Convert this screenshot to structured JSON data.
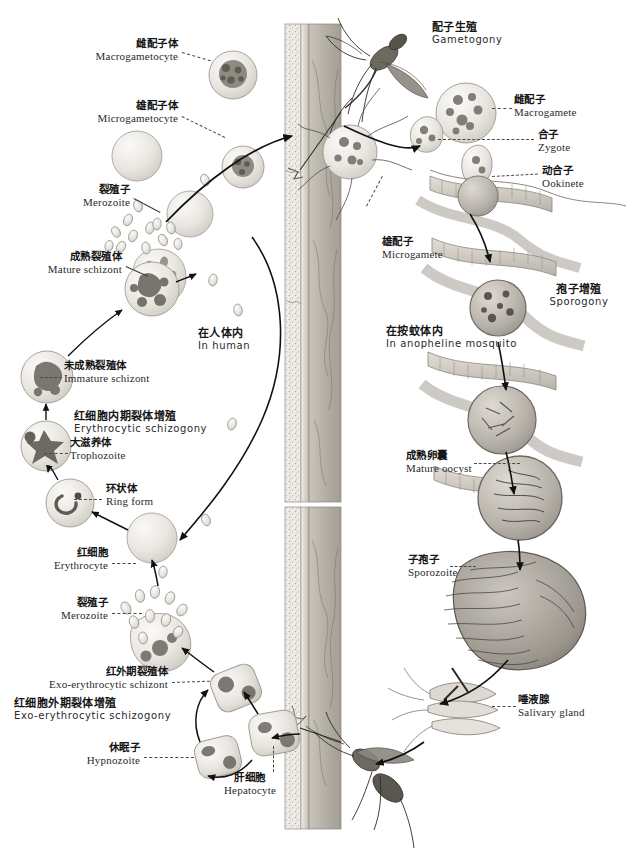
{
  "figure": {
    "title_cn": "疟原虫生活史",
    "title_en": "Life cycle of Plasmodium",
    "width": 626,
    "height": 859,
    "style": "grayscale scientific illustration"
  },
  "colors": {
    "background": "#ffffff",
    "ink": "#1b1b1b",
    "label_en": "#2a2a2a",
    "leader": "#4a4a4a",
    "arrow": "#111111",
    "cell_fill": "#e8e6e2",
    "cell_stroke": "#9a978f",
    "nucleus": "#6f6b63",
    "skin_outer": "#d8d4cd",
    "skin_inner": "#b9b4ab",
    "vessel": "#a9a49b",
    "mosquito": "#6b6760",
    "gut_wall": "#cfcac2"
  },
  "regions": {
    "human": {
      "cn": "在人体内",
      "en": "In human",
      "x": 196,
      "y": 330
    },
    "mosquito": {
      "cn": "在按蚊体内",
      "en": "In anopheline mosquito",
      "x": 393,
      "y": 328
    }
  },
  "processes": [
    {
      "name": "erythrocytic-schizogony",
      "cn": "红细胞内期裂体增殖",
      "en": "Erythrocytic schizogony",
      "x": 72,
      "y": 413,
      "align": "left"
    },
    {
      "name": "exo-erythrocytic-schizogony",
      "cn": "红细胞外期裂体增殖",
      "en": "Exo-erythrocytic schizogony",
      "x": 12,
      "y": 700,
      "align": "left"
    },
    {
      "name": "gametogony",
      "cn": "配子生殖",
      "en": "Gametogony",
      "x": 430,
      "y": 24,
      "align": "left"
    },
    {
      "name": "sporogony",
      "cn": "孢子增殖",
      "en": "Sporogony",
      "x": 578,
      "y": 286,
      "align": "center"
    }
  ],
  "labels": [
    {
      "name": "macrogametocyte",
      "cn": "雌配子体",
      "en": "Macrogametocyte",
      "x": 178,
      "y": 40,
      "align": "right"
    },
    {
      "name": "microgametocyte",
      "cn": "雄配子体",
      "en": "Microgametocyte",
      "x": 178,
      "y": 102,
      "align": "right"
    },
    {
      "name": "merozoite-upper",
      "cn": "裂殖子",
      "en": "Merozoite",
      "x": 130,
      "y": 186,
      "align": "right"
    },
    {
      "name": "mature-schizont",
      "cn": "成熟裂殖体",
      "en": "Mature schizont",
      "x": 122,
      "y": 253,
      "align": "right"
    },
    {
      "name": "immature-schizont",
      "cn": "未成熟裂殖体",
      "en": "Immature schizont",
      "x": 60,
      "y": 362,
      "align": "left"
    },
    {
      "name": "trophozoite",
      "cn": "大滋养体",
      "en": "Trophozoite",
      "x": 66,
      "y": 440,
      "align": "left"
    },
    {
      "name": "ring-form",
      "cn": "环状体",
      "en": "Ring form",
      "x": 104,
      "y": 487,
      "align": "left"
    },
    {
      "name": "erythrocyte",
      "cn": "红细胞",
      "en": "Erythrocyte",
      "x": 108,
      "y": 550,
      "align": "right"
    },
    {
      "name": "merozoite-lower",
      "cn": "裂殖子",
      "en": "Merozoite",
      "x": 108,
      "y": 600,
      "align": "right"
    },
    {
      "name": "exo-erythrocytic-schizont",
      "cn": "红外期裂殖体",
      "en": "Exo-erythrocytic schizont",
      "x": 168,
      "y": 668,
      "align": "right"
    },
    {
      "name": "hypnozoite",
      "cn": "休眠子",
      "en": "Hypnozoite",
      "x": 140,
      "y": 744,
      "align": "right"
    },
    {
      "name": "hepatocyte",
      "cn": "肝细胞",
      "en": "Hepatocyte",
      "x": 250,
      "y": 778,
      "align": "center"
    },
    {
      "name": "macrogamete",
      "cn": "雌配子",
      "en": "Macrogamete",
      "x": 512,
      "y": 96,
      "align": "left"
    },
    {
      "name": "zygote",
      "cn": "合子",
      "en": "Zygote",
      "x": 536,
      "y": 131,
      "align": "left"
    },
    {
      "name": "ookinete",
      "cn": "动合子",
      "en": "Ookinete",
      "x": 540,
      "y": 167,
      "align": "left"
    },
    {
      "name": "microgamete",
      "cn": "雄配子",
      "en": "Microgamete",
      "x": 380,
      "y": 238,
      "align": "left"
    },
    {
      "name": "mature-oocyst",
      "cn": "成熟卵囊",
      "en": "Mature oocyst",
      "x": 404,
      "y": 452,
      "align": "left"
    },
    {
      "name": "sporozoite",
      "cn": "子孢子",
      "en": "Sporozoite",
      "x": 406,
      "y": 556,
      "align": "left"
    },
    {
      "name": "salivary-gland",
      "cn": "唾液腺",
      "en": "Salivary gland",
      "x": 516,
      "y": 696,
      "align": "left"
    }
  ],
  "artwork": {
    "skin_columns": [
      {
        "name": "upper-skin-section",
        "x": 283,
        "y": 22,
        "w": 58,
        "h": 480
      },
      {
        "name": "lower-skin-section",
        "x": 283,
        "y": 505,
        "w": 58,
        "h": 325
      }
    ],
    "mosquitoes": [
      {
        "name": "feeding-mosquito-top",
        "x": 330,
        "y": 28
      },
      {
        "name": "feeding-mosquito-bottom",
        "x": 330,
        "y": 735
      }
    ],
    "blood_cells": [
      {
        "name": "macrogametocyte-cell",
        "cx": 233,
        "cy": 75,
        "r": 24,
        "kind": "granular"
      },
      {
        "name": "microgametocyte-cell",
        "cx": 243,
        "cy": 167,
        "r": 21,
        "kind": "granular"
      },
      {
        "name": "plain-erythrocyte-upper",
        "cx": 137,
        "cy": 156,
        "r": 25,
        "kind": "plain"
      },
      {
        "name": "plain-erythrocyte-mid",
        "cx": 190,
        "cy": 214,
        "r": 23,
        "kind": "plain"
      },
      {
        "name": "bursting-schizont",
        "cx": 160,
        "cy": 275,
        "r": 26,
        "kind": "bursting"
      },
      {
        "name": "mature-schizont-cell",
        "cx": 152,
        "cy": 289,
        "r": 27,
        "kind": "schizont"
      },
      {
        "name": "immature-schizont-cell",
        "cx": 47,
        "cy": 377,
        "r": 26,
        "kind": "schizont"
      },
      {
        "name": "trophozoite-cell",
        "cx": 46,
        "cy": 446,
        "r": 25,
        "kind": "trophozoite"
      },
      {
        "name": "ring-form-cell",
        "cx": 70,
        "cy": 503,
        "r": 24,
        "kind": "ring"
      },
      {
        "name": "erythrocyte-cell",
        "cx": 152,
        "cy": 538,
        "r": 25,
        "kind": "plain"
      }
    ],
    "liver_cells": [
      {
        "name": "exo-erythrocytic-schizont-cell",
        "x": 213,
        "y": 676
      },
      {
        "name": "hypnozoite-cell",
        "x": 196,
        "y": 745
      },
      {
        "name": "hepatocyte-cell",
        "x": 252,
        "y": 722
      },
      {
        "name": "rupturing-liver-cell",
        "x": 148,
        "y": 617
      }
    ],
    "gut_oocysts": [
      {
        "name": "oocyst-stage-1",
        "cx": 478,
        "cy": 196,
        "r": 22
      },
      {
        "name": "oocyst-stage-2",
        "cx": 496,
        "cy": 310,
        "r": 28
      },
      {
        "name": "oocyst-stage-3",
        "cx": 500,
        "cy": 420,
        "r": 34
      },
      {
        "name": "oocyst-mature",
        "cx": 520,
        "cy": 500,
        "r": 42
      },
      {
        "name": "sporozoite-mass",
        "cx": 524,
        "cy": 600,
        "r": 62
      }
    ]
  }
}
